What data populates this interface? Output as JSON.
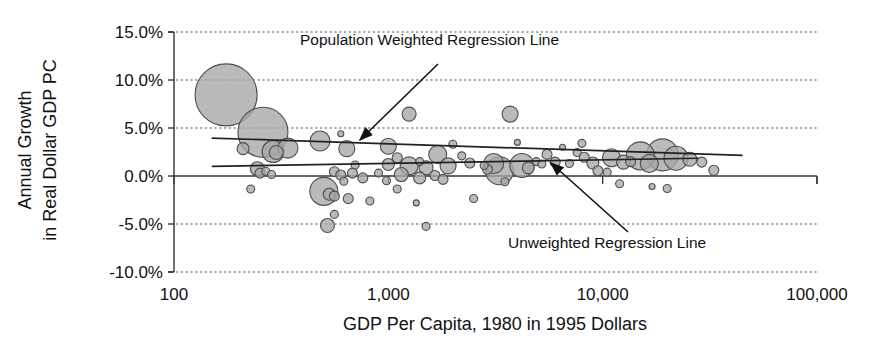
{
  "chart_data": {
    "type": "scatter",
    "subtype": "bubble",
    "title": "",
    "xlabel": "GDP Per Capita, 1980 in 1995 Dollars",
    "ylabel": "Annual Growth in Real Dollar GDP PC",
    "xscale": "log",
    "xlim": [
      100,
      100000
    ],
    "ylim": [
      -10,
      15
    ],
    "x_ticks": [
      100,
      1000,
      10000,
      100000
    ],
    "x_tick_labels": [
      "100",
      "1,000",
      "10,000",
      "100,000"
    ],
    "y_ticks": [
      15,
      10,
      5,
      0,
      -5,
      -10
    ],
    "y_tick_labels": [
      "15.0%",
      "10.0%",
      "5.0%",
      "0.0%",
      "-5.0%",
      "-10.0%"
    ],
    "grid": "horizontal-dashed",
    "zero_line": "solid",
    "legend": "none",
    "bubble_fill": "#a6a6a6",
    "bubble_stroke": "#4d4d4d",
    "bubble_size_meaning": "population",
    "annotations": [
      {
        "label": "Population Weighted Regression Line",
        "text_x": 300,
        "text_y": 45,
        "arrow_from_x": 438,
        "arrow_from_y": 64,
        "arrow_to_x": 360,
        "arrow_to_y": 140
      },
      {
        "label": "Unweighted Regression Line",
        "text_x": 508,
        "text_y": 248,
        "arrow_from_x": 628,
        "arrow_from_y": 232,
        "arrow_to_x": 551,
        "arrow_to_y": 163
      }
    ],
    "series": [
      {
        "name": "Population Weighted Regression Line",
        "type": "line",
        "points": [
          [
            150,
            3.95
          ],
          [
            45000,
            2.15
          ]
        ]
      },
      {
        "name": "Unweighted Regression Line",
        "type": "line",
        "points": [
          [
            150,
            1.0
          ],
          [
            28000,
            1.85
          ]
        ]
      }
    ],
    "bubbles": [
      {
        "x": 175,
        "y": 8.45,
        "r": 31
      },
      {
        "x": 260,
        "y": 4.55,
        "r": 25
      },
      {
        "x": 290,
        "y": 2.55,
        "r": 11
      },
      {
        "x": 300,
        "y": 2.45,
        "r": 7
      },
      {
        "x": 210,
        "y": 2.85,
        "r": 6
      },
      {
        "x": 340,
        "y": 2.9,
        "r": 10
      },
      {
        "x": 245,
        "y": 0.75,
        "r": 7
      },
      {
        "x": 252,
        "y": 0.3,
        "r": 5
      },
      {
        "x": 268,
        "y": 0.5,
        "r": 4
      },
      {
        "x": 285,
        "y": 0.15,
        "r": 4
      },
      {
        "x": 228,
        "y": -1.35,
        "r": 4
      },
      {
        "x": 480,
        "y": 3.65,
        "r": 10
      },
      {
        "x": 640,
        "y": 2.85,
        "r": 8
      },
      {
        "x": 700,
        "y": 1.15,
        "r": 4
      },
      {
        "x": 560,
        "y": 0.45,
        "r": 5
      },
      {
        "x": 600,
        "y": 0.1,
        "r": 5
      },
      {
        "x": 680,
        "y": 0.3,
        "r": 5
      },
      {
        "x": 620,
        "y": -0.55,
        "r": 4
      },
      {
        "x": 760,
        "y": -0.2,
        "r": 5
      },
      {
        "x": 500,
        "y": -1.6,
        "r": 14
      },
      {
        "x": 530,
        "y": -1.9,
        "r": 6
      },
      {
        "x": 560,
        "y": -2.1,
        "r": 5
      },
      {
        "x": 650,
        "y": -2.35,
        "r": 5
      },
      {
        "x": 820,
        "y": -2.6,
        "r": 4
      },
      {
        "x": 560,
        "y": -4.0,
        "r": 4
      },
      {
        "x": 520,
        "y": -5.15,
        "r": 7
      },
      {
        "x": 1000,
        "y": 3.1,
        "r": 8
      },
      {
        "x": 1250,
        "y": 6.45,
        "r": 7
      },
      {
        "x": 1100,
        "y": 1.9,
        "r": 5
      },
      {
        "x": 1400,
        "y": 1.5,
        "r": 4
      },
      {
        "x": 1700,
        "y": 2.25,
        "r": 9
      },
      {
        "x": 1000,
        "y": 1.2,
        "r": 6
      },
      {
        "x": 1250,
        "y": 1.05,
        "r": 9
      },
      {
        "x": 1500,
        "y": 0.85,
        "r": 7
      },
      {
        "x": 1900,
        "y": 1.05,
        "r": 8
      },
      {
        "x": 1150,
        "y": 0.15,
        "r": 7
      },
      {
        "x": 1400,
        "y": -0.2,
        "r": 6
      },
      {
        "x": 1650,
        "y": 0.05,
        "r": 5
      },
      {
        "x": 1800,
        "y": -0.35,
        "r": 5
      },
      {
        "x": 900,
        "y": 0.3,
        "r": 4
      },
      {
        "x": 980,
        "y": -0.5,
        "r": 4
      },
      {
        "x": 1100,
        "y": -1.35,
        "r": 4
      },
      {
        "x": 1350,
        "y": -2.8,
        "r": 3
      },
      {
        "x": 1500,
        "y": -5.25,
        "r": 4
      },
      {
        "x": 2400,
        "y": 1.35,
        "r": 5
      },
      {
        "x": 2800,
        "y": 1.1,
        "r": 4
      },
      {
        "x": 3100,
        "y": 1.3,
        "r": 10
      },
      {
        "x": 3300,
        "y": 0.55,
        "r": 14
      },
      {
        "x": 3700,
        "y": 6.45,
        "r": 8
      },
      {
        "x": 2900,
        "y": 0.7,
        "r": 5
      },
      {
        "x": 3500,
        "y": -0.6,
        "r": 4
      },
      {
        "x": 4200,
        "y": 1.1,
        "r": 12
      },
      {
        "x": 4500,
        "y": 0.85,
        "r": 6
      },
      {
        "x": 4900,
        "y": 1.5,
        "r": 4
      },
      {
        "x": 5200,
        "y": 1.25,
        "r": 4
      },
      {
        "x": 2500,
        "y": -2.35,
        "r": 4
      },
      {
        "x": 5500,
        "y": 2.25,
        "r": 5
      },
      {
        "x": 6000,
        "y": 1.45,
        "r": 5
      },
      {
        "x": 7000,
        "y": 1.3,
        "r": 4
      },
      {
        "x": 7600,
        "y": 2.45,
        "r": 4
      },
      {
        "x": 8200,
        "y": 1.95,
        "r": 5
      },
      {
        "x": 9000,
        "y": 1.35,
        "r": 6
      },
      {
        "x": 9500,
        "y": 0.55,
        "r": 5
      },
      {
        "x": 11000,
        "y": 1.9,
        "r": 9
      },
      {
        "x": 12500,
        "y": 1.45,
        "r": 7
      },
      {
        "x": 13500,
        "y": 1.5,
        "r": 5
      },
      {
        "x": 15000,
        "y": 2.1,
        "r": 14
      },
      {
        "x": 16500,
        "y": 1.3,
        "r": 9
      },
      {
        "x": 19000,
        "y": 2.2,
        "r": 16
      },
      {
        "x": 22000,
        "y": 1.85,
        "r": 12
      },
      {
        "x": 25500,
        "y": 1.75,
        "r": 7
      },
      {
        "x": 29000,
        "y": 1.45,
        "r": 5
      },
      {
        "x": 10500,
        "y": 0.4,
        "r": 4
      },
      {
        "x": 12000,
        "y": -0.8,
        "r": 4
      },
      {
        "x": 17000,
        "y": -1.1,
        "r": 3
      },
      {
        "x": 20000,
        "y": -1.3,
        "r": 4
      },
      {
        "x": 33000,
        "y": 0.6,
        "r": 5
      },
      {
        "x": 8000,
        "y": 3.4,
        "r": 4
      },
      {
        "x": 2000,
        "y": 3.3,
        "r": 4
      },
      {
        "x": 2200,
        "y": 2.1,
        "r": 4
      },
      {
        "x": 6500,
        "y": 3.0,
        "r": 3
      },
      {
        "x": 4000,
        "y": 3.5,
        "r": 3
      },
      {
        "x": 600,
        "y": 4.4,
        "r": 3
      }
    ]
  }
}
